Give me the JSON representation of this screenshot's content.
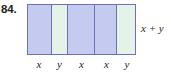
{
  "exercise": {
    "number_label": "84."
  },
  "figure": {
    "type": "segmented-bar-diagram",
    "total_label": "x + y",
    "segments": [
      {
        "label": "x",
        "fill": "blue",
        "color": "#c4cbee",
        "width_pct": 22.0
      },
      {
        "label": "y",
        "fill": "green",
        "color": "#e4f2e8",
        "width_pct": 15.6
      },
      {
        "label": "x",
        "fill": "blue",
        "color": "#c4cbee",
        "width_pct": 24.8
      },
      {
        "label": "x",
        "fill": "blue",
        "color": "#c4cbee",
        "width_pct": 21.1
      },
      {
        "label": "y",
        "fill": "green",
        "color": "#e4f2e8",
        "width_pct": 16.5
      }
    ],
    "border_color": "#6b72b8",
    "text_color": "#231f20"
  }
}
